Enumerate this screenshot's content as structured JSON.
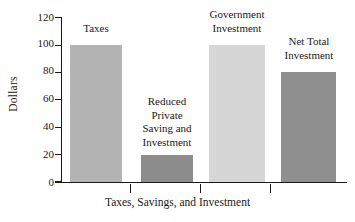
{
  "chart_data": {
    "type": "bar",
    "title": "",
    "xlabel": "Taxes, Savings, and Investment",
    "ylabel": "Dollars",
    "ylim": [
      0,
      120
    ],
    "yticks": [
      0,
      20,
      40,
      60,
      80,
      100,
      120
    ],
    "ytick_labels": [
      "0",
      "20",
      "40",
      "60",
      "80",
      "100",
      "120"
    ],
    "grid": false,
    "legend": "none",
    "categories": [
      "Taxes",
      "Reduced Private Saving and Investment",
      "Government Investment",
      "Net Total Investment"
    ],
    "values": [
      100,
      20,
      100,
      80
    ],
    "bar_labels": [
      "Taxes",
      "Reduced\nPrivate\nSaving and\nInvestment",
      "Government\nInvestment",
      "Net Total\nInvestment"
    ],
    "bar_colors": [
      "#b3b3b3",
      "#8c8c8c",
      "#d6d6d6",
      "#8f8f8f"
    ],
    "axis_color": "#1a1a1a",
    "background_color": "#ffffff"
  },
  "bars": [
    {
      "label": "Taxes",
      "value": 100,
      "color": "#b3b3b3"
    },
    {
      "label": "Reduced\nPrivate\nSaving and\nInvestment",
      "value": 20,
      "color": "#8c8c8c"
    },
    {
      "label": "Government\nInvestment",
      "value": 100,
      "color": "#d6d6d6"
    },
    {
      "label": "Net Total\nInvestment",
      "value": 80,
      "color": "#8f8f8f"
    }
  ],
  "axes": {
    "y_label": "Dollars",
    "x_label": "Taxes, Savings, and Investment",
    "y_ticks": [
      "120",
      "100",
      "80",
      "60",
      "40",
      "20",
      "0"
    ]
  }
}
